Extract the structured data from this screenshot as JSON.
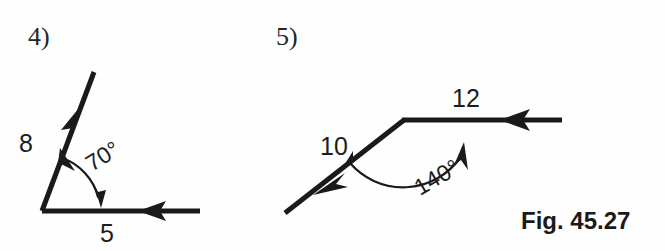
{
  "figure": {
    "caption": "Fig. 45.27",
    "background_color": "#fefefe",
    "ink_color": "#1a1a1a"
  },
  "problems": [
    {
      "number_label": "4)",
      "kind": "vector-angle-diagram",
      "vertex": [
        42,
        211
      ],
      "vectors": [
        {
          "magnitude_label": "8",
          "label_position": [
            26,
            152
          ],
          "from": [
            42,
            211
          ],
          "to": [
            94,
            72
          ],
          "arrow_at": [
            72,
            128
          ],
          "arrow_direction": "up-right",
          "direction_degrees_ccw_from_east": 69
        },
        {
          "magnitude_label": "5",
          "label_position": [
            100,
            242
          ],
          "from": [
            42,
            211
          ],
          "to": [
            200,
            211
          ],
          "arrow_at": [
            155,
            211
          ],
          "arrow_direction": "left",
          "direction_degrees_ccw_from_east": 180
        }
      ],
      "angle": {
        "label": "70°",
        "value": 70,
        "label_position": [
          92,
          172
        ],
        "label_rotation_degrees": -32,
        "arc_radius": 56,
        "double_headed": true
      }
    },
    {
      "number_label": "5)",
      "kind": "vector-angle-diagram",
      "vertex": [
        404,
        120
      ],
      "vectors": [
        {
          "magnitude_label": "10",
          "label_position": [
            320,
            155
          ],
          "from": [
            404,
            120
          ],
          "to": [
            285,
            213
          ],
          "arrow_at": [
            335,
            182
          ],
          "arrow_direction": "down-left",
          "direction_degrees_ccw_from_east": 218
        },
        {
          "magnitude_label": "12",
          "label_position": [
            452,
            107
          ],
          "from": [
            404,
            120
          ],
          "to": [
            562,
            120
          ],
          "arrow_at": [
            518,
            120
          ],
          "arrow_direction": "left",
          "direction_degrees_ccw_from_east": 180
        }
      ],
      "angle": {
        "label": "140°",
        "value": 140,
        "label_position": [
          430,
          190
        ],
        "label_rotation_degrees": -30,
        "arc_radius": 70,
        "double_headed": true
      }
    }
  ]
}
